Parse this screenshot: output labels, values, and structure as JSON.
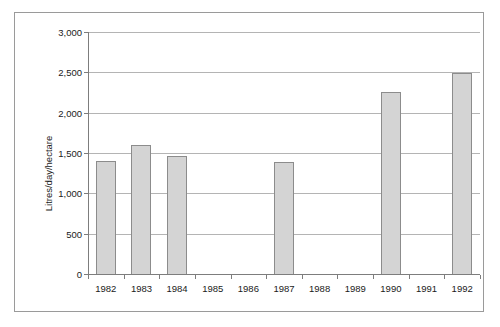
{
  "chart_data": {
    "type": "bar",
    "title": "",
    "subtitle": "",
    "xlabel": "",
    "ylabel": "Litres/day/hectare",
    "categories": [
      "1982",
      "1983",
      "1984",
      "1985",
      "1986",
      "1987",
      "1988",
      "1989",
      "1990",
      "1991",
      "1992"
    ],
    "values": [
      1400,
      1600,
      1460,
      0,
      0,
      1390,
      0,
      0,
      2260,
      0,
      2490
    ],
    "series": [
      {
        "name": "Litres/day/hectare",
        "values": [
          1400,
          1600,
          1460,
          0,
          0,
          1390,
          0,
          0,
          2260,
          0,
          2490
        ]
      }
    ],
    "ylim": [
      0,
      3000
    ],
    "ytick_values": [
      0,
      500,
      1000,
      1500,
      2000,
      2500,
      3000
    ],
    "ytick_labels": [
      "0",
      "500",
      "1,000",
      "1,500",
      "2,000",
      "2,500",
      "3,000"
    ],
    "grid": true,
    "grid_axis": "y",
    "legend": false,
    "legend_position": "none",
    "bar_color": "#d4d4d4",
    "bar_border_color": "#8c8c8c",
    "gridline_color": "#b4b4b4",
    "axis_color": "#7d7d7d",
    "frame_color": "#9a9a9a",
    "background": "#ffffff",
    "missing_years": [
      "1985",
      "1986",
      "1988",
      "1989",
      "1991"
    ],
    "annotations": []
  }
}
